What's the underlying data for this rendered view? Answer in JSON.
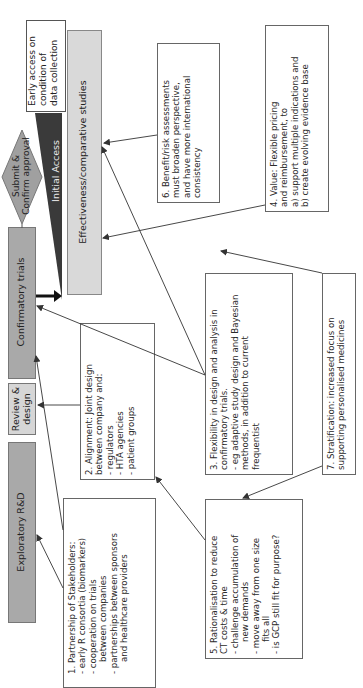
{
  "stages": {
    "exploratory": "Exploratory R&D",
    "review_design": [
      "Review &",
      "design"
    ],
    "confirmatory": "Confirmatory trials",
    "submit_approval": [
      "Submit &",
      "Confirm approval"
    ],
    "initial_access": "Initial Access",
    "early_access": [
      "Early access on",
      "condition of",
      "data collection"
    ],
    "effectiveness": "Effectiveness/comparative studies"
  },
  "notes": {
    "n1": [
      "1. Partnership of Stakeholders:",
      "- early R consortia (biomarkers)",
      "- cooperation on trials",
      "  between companies",
      "- partnerships between sponsors",
      "  and healthcare providers"
    ],
    "n2": [
      "2. Alignment: Joint design",
      "between company and:",
      "- regulators",
      "- HTA agencies",
      "- patient groups"
    ],
    "n3": [
      "3. Flexibility in design and analysis in",
      "confirmatory trials.",
      "- eg adaptive study design and Bayesian",
      "methods, in addition to current",
      "frequentist"
    ],
    "n4": [
      "4. Value: Flexible pricing",
      "and reimbursement, to",
      "a) support multiple indications and",
      "b) create evolving evidence base"
    ],
    "n5": [
      "5. Rationalisation to reduce",
      "CT costs & time",
      "- challenge accumulation of",
      "  new demands",
      "- move away from one size",
      "  fits all",
      "- is GCP still fit for purpose?"
    ],
    "n6": [
      "6. Benefit/risk assessments",
      "must broaden perspective,",
      "and have more international",
      "consistency"
    ],
    "n7": [
      "7. Stratification: increased focus on",
      "supporting personalised medicines"
    ]
  },
  "colors": {
    "stage_gray": "#a9a9a9",
    "stage_light": "#d6d6d6",
    "initial_access": "#3a3a3a",
    "effectiveness": "#d9d9d9",
    "line": "#333333"
  }
}
